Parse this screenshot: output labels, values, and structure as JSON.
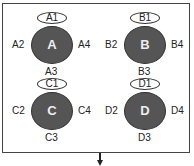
{
  "nodes": [
    {
      "id": "A",
      "top": "A1",
      "left": "A2",
      "bottom": "A3",
      "right": "A4",
      "cx": 52,
      "cy": 45
    },
    {
      "id": "B",
      "top": "B1",
      "left": "B2",
      "bottom": "B3",
      "right": "B4",
      "cx": 145,
      "cy": 45
    },
    {
      "id": "C",
      "top": "C1",
      "left": "C2",
      "bottom": "C3",
      "right": "C4",
      "cx": 52,
      "cy": 111
    },
    {
      "id": "D",
      "top": "D1",
      "left": "D2",
      "bottom": "D3",
      "right": "D4",
      "cx": 145,
      "cy": 111
    }
  ],
  "colors": {
    "circle_fill": "#555555",
    "border": "#333333"
  }
}
